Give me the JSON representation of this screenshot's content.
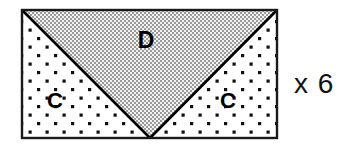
{
  "figure": {
    "outline": {
      "stroke_color": "#1a1a1a",
      "stroke_width": 2.4,
      "x": 22,
      "y": 10,
      "width": 255,
      "height": 128
    },
    "regions": [
      {
        "id": "region-c-left",
        "label": "C",
        "fill_style": "sparse-square-dots",
        "fill_background": "#ffffff",
        "dot_color": "#101010",
        "label_x": 55,
        "label_y": 101
      },
      {
        "id": "region-d-center",
        "label": "D",
        "fill_style": "fine-checkerboard-stipple",
        "fill_background": "#e8e8e8",
        "dot_color": "#3a3a3a",
        "label_x": 146,
        "label_y": 41
      },
      {
        "id": "region-c-right",
        "label": "C",
        "fill_style": "sparse-square-dots",
        "fill_background": "#ffffff",
        "dot_color": "#101010",
        "label_x": 228,
        "label_y": 101
      }
    ],
    "diagonals": {
      "stroke_color": "#000000",
      "stroke_width": 2.6,
      "apex_x": 150,
      "apex_y": 138
    }
  },
  "annotation": {
    "multiplier": "x 6",
    "x": 294,
    "y": 70
  },
  "colors": {
    "background": "#ffffff",
    "ink": "#000000",
    "triangle_gray": "#e8e8e8"
  }
}
